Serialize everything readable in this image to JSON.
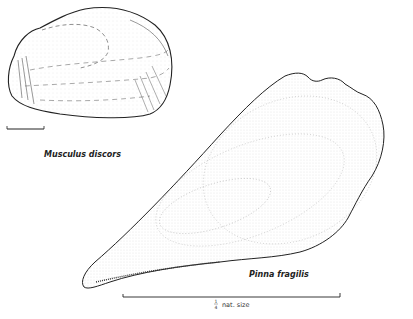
{
  "figure": {
    "specimens": [
      {
        "id": "musculus",
        "name": "Musculus discors",
        "scale_bar": "unlabeled short bar"
      },
      {
        "id": "pinna",
        "name": "Pinna fragilis"
      }
    ],
    "scale": {
      "fraction_num": "1",
      "fraction_den": "4",
      "text": "nat. size"
    },
    "colors": {
      "ink": "#222222",
      "stipple": "#8a8a8a",
      "background": "#ffffff"
    }
  }
}
